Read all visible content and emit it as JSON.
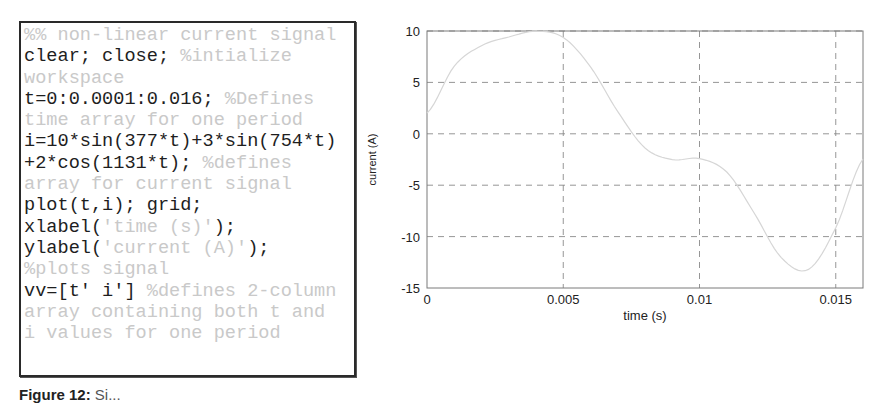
{
  "code_panel": {
    "lines": [
      [
        {
          "t": "comment",
          "s": "%% non-linear current signal"
        }
      ],
      [
        {
          "t": "code",
          "s": "clear; close; "
        },
        {
          "t": "comment",
          "s": "%intialize"
        }
      ],
      [
        {
          "t": "comment",
          "s": "workspace"
        }
      ],
      [
        {
          "t": "code",
          "s": "t=0:0.0001:0.016; "
        },
        {
          "t": "comment",
          "s": "%Defines"
        }
      ],
      [
        {
          "t": "comment",
          "s": "time array for one period"
        }
      ],
      [
        {
          "t": "code",
          "s": "i=10*sin(377*t)+3*sin(754*t)"
        }
      ],
      [
        {
          "t": "code",
          "s": "+2*cos(1131*t); "
        },
        {
          "t": "comment",
          "s": "%defines"
        }
      ],
      [
        {
          "t": "comment",
          "s": "array for current signal"
        }
      ],
      [
        {
          "t": "code",
          "s": "plot(t,i); grid;"
        }
      ],
      [
        {
          "t": "code",
          "s": "xlabel("
        },
        {
          "t": "comment",
          "s": "'time (s)'"
        },
        {
          "t": "code",
          "s": ");"
        }
      ],
      [
        {
          "t": "code",
          "s": "ylabel("
        },
        {
          "t": "comment",
          "s": "'current (A)'"
        },
        {
          "t": "code",
          "s": ");"
        }
      ],
      [
        {
          "t": "comment",
          "s": "%plots signal"
        }
      ],
      [
        {
          "t": "code",
          "s": "vv=[t' i'] "
        },
        {
          "t": "comment",
          "s": "%defines 2-column"
        }
      ],
      [
        {
          "t": "comment",
          "s": "array containing both t and"
        }
      ],
      [
        {
          "t": "comment",
          "s": "i values for one period"
        }
      ]
    ]
  },
  "caption": {
    "label": "Figure 12:",
    "text": "Si..."
  },
  "colors": {
    "code_text": "#1e1e1e",
    "comment_text": "#c9c9c9",
    "grid": "#8a8a8a",
    "axis": "#7a7a7a",
    "curve": "#d6d6d6"
  },
  "chart_data": {
    "type": "line",
    "title": "",
    "xlabel": "time (s)",
    "ylabel": "current (A)",
    "xlim": [
      0,
      0.016
    ],
    "ylim": [
      -15,
      10
    ],
    "xticks": [
      0,
      0.005,
      0.01,
      0.015
    ],
    "xtick_labels": [
      "0",
      "0.005",
      "0.01",
      "0.015"
    ],
    "yticks": [
      10,
      5,
      0,
      -5,
      -10,
      -15
    ],
    "ytick_labels": [
      "10",
      "5",
      "0",
      "-5",
      "-10",
      "-15"
    ],
    "grid": true,
    "legend": null,
    "series": [
      {
        "name": "i = 10*sin(377*t)+3*sin(754*t)+2*cos(1131*t)",
        "x": [
          0,
          0.001,
          0.002,
          0.003,
          0.004,
          0.005,
          0.006,
          0.007,
          0.008,
          0.009,
          0.01,
          0.011,
          0.012,
          0.013,
          0.014,
          0.015,
          0.016
        ],
        "y": [
          2.0,
          6.58,
          8.57,
          9.42,
          9.98,
          9.37,
          6.51,
          2.16,
          -1.38,
          -2.51,
          -2.41,
          -3.72,
          -7.68,
          -12.04,
          -13.19,
          -9.14,
          -2.45
        ]
      }
    ]
  }
}
